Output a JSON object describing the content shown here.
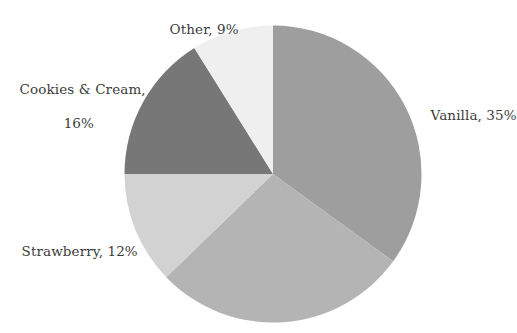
{
  "chart": {
    "figure_name": "ice-cream-flavor-share-pie"
  },
  "chart_data": {
    "type": "pie",
    "title": "",
    "subtitle": "",
    "xlabel": "",
    "ylabel": "",
    "legend": "none",
    "grid": false,
    "label_format": "{name}, {percent}%",
    "start_angle_deg": 0,
    "direction": "clockwise",
    "center": {
      "x": 273,
      "y": 174
    },
    "radius": 148.5,
    "slices": [
      {
        "name": "Vanilla",
        "percent": 35,
        "label": "Vanilla, 35%",
        "label_shown": true,
        "color": "#9e9e9e",
        "start_deg": 0,
        "end_deg": 126
      },
      {
        "name": "",
        "percent": 28,
        "label": "",
        "label_shown": false,
        "color": "#b4b4b4",
        "start_deg": 126,
        "end_deg": 226
      },
      {
        "name": "Strawberry",
        "percent": 12,
        "label": "Strawberry, 12%",
        "label_shown": true,
        "color": "#d2d2d2",
        "start_deg": 226,
        "end_deg": 270
      },
      {
        "name": "Cookies & Cream",
        "percent": 16,
        "label_line1": "Cookies & Cream,",
        "label_line2": "16%",
        "label_shown": true,
        "color": "#777777",
        "start_deg": 270,
        "end_deg": 328
      },
      {
        "name": "Other",
        "percent": 9,
        "label": "Other, 9%",
        "label_shown": true,
        "color": "#efefef",
        "start_deg": 328,
        "end_deg": 360
      }
    ],
    "categories": [
      "Vanilla",
      "",
      "Strawberry",
      "Cookies & Cream",
      "Other"
    ],
    "values": [
      35,
      28,
      12,
      16,
      9
    ],
    "colors": [
      "#9e9e9e",
      "#b4b4b4",
      "#d2d2d2",
      "#777777",
      "#efefef"
    ],
    "background": "#ffffff"
  }
}
